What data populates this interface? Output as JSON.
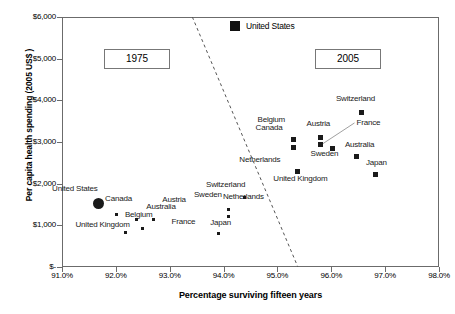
{
  "chart_data": {
    "type": "scatter",
    "title": "",
    "xlabel": "Percentage surviving fifteen years",
    "ylabel": "Per capita health spending (2005 US$ )",
    "xlim": [
      91.0,
      98.0
    ],
    "ylim": [
      0,
      6000
    ],
    "xticks": [
      "91.0%",
      "92.0%",
      "93.0%",
      "94.0%",
      "95.0%",
      "96.0%",
      "97.0%",
      "98.0%"
    ],
    "xtick_values": [
      91.0,
      92.0,
      93.0,
      94.0,
      95.0,
      96.0,
      97.0,
      98.0
    ],
    "yticks": [
      "$-",
      "$1,000",
      "$2,000",
      "$3,000",
      "$4,000",
      "$5,000",
      "$6,000"
    ],
    "ytick_values": [
      0,
      1000,
      2000,
      3000,
      4000,
      5000,
      6000
    ],
    "grid": false,
    "legend_position": "top-center",
    "legend": [
      {
        "label": "United States",
        "marker": "filled-square"
      }
    ],
    "annotations": [
      {
        "text": "1975",
        "type": "boxed-era-label"
      },
      {
        "text": "2005",
        "type": "boxed-era-label"
      },
      {
        "text": "",
        "type": "dashed-divider-line",
        "from": [
          93.42,
          6000
        ],
        "to": [
          95.38,
          0
        ]
      }
    ],
    "series": [
      {
        "name": "1975",
        "points": [
          {
            "label": "United States",
            "x": 91.67,
            "y": 1530,
            "marker": "big-circle",
            "label_dx": -46,
            "label_dy": -14
          },
          {
            "label": "Canada",
            "x": 91.67,
            "y": 1530,
            "marker": "none",
            "label_dx": 7,
            "label_dy": -4
          },
          {
            "label": "Austria",
            "x": 92.38,
            "y": 1130,
            "marker": "small-square",
            "label_dx": 26,
            "label_dy": -20
          },
          {
            "label": "Australia",
            "x": 92.38,
            "y": 1130,
            "marker": "none",
            "label_dx": 10,
            "label_dy": -13
          },
          {
            "label": "Belgium",
            "x": 92.02,
            "y": 1250,
            "marker": "small-square",
            "label_dx": 8,
            "label_dy": 0
          },
          {
            "label": "United Kingdom",
            "x": 92.18,
            "y": 820,
            "marker": "small-square",
            "label_dx": -50,
            "label_dy": -8
          },
          {
            "label": "France",
            "x": 92.7,
            "y": 1140,
            "marker": "small-square",
            "label_dx": 18,
            "label_dy": 2
          },
          {
            "label": "",
            "x": 92.5,
            "y": 930,
            "marker": "small-square",
            "label_dx": 0,
            "label_dy": 0
          },
          {
            "label": "Switzerland",
            "x": 94.38,
            "y": 1660,
            "marker": "small-square",
            "label_dx": -38,
            "label_dy": -13
          },
          {
            "label": "Sweden",
            "x": 94.1,
            "y": 1220,
            "marker": "small-square",
            "label_dx": -35,
            "label_dy": -21
          },
          {
            "label": "Netherlands",
            "x": 94.1,
            "y": 1380,
            "marker": "small-square",
            "label_dx": -6,
            "label_dy": -13
          },
          {
            "label": "Japan",
            "x": 93.9,
            "y": 800,
            "marker": "small-square",
            "label_dx": -8,
            "label_dy": -11
          }
        ]
      },
      {
        "name": "2005",
        "points": [
          {
            "label": "Switzerland",
            "x": 96.57,
            "y": 3710,
            "marker": "square",
            "label_dx": -26,
            "label_dy": -13
          },
          {
            "label": "Belgium",
            "x": 95.3,
            "y": 3050,
            "marker": "square",
            "label_dx": -36,
            "label_dy": -20
          },
          {
            "label": "Canada",
            "x": 95.3,
            "y": 2860,
            "marker": "square",
            "label_dx": -38,
            "label_dy": -20
          },
          {
            "label": "Austria",
            "x": 95.8,
            "y": 3120,
            "marker": "square",
            "label_dx": -14,
            "label_dy": -13
          },
          {
            "label": "France",
            "x": 95.8,
            "y": 2930,
            "marker": "square",
            "label_dx": 36,
            "label_dy": -22
          },
          {
            "label": "Australia",
            "x": 96.03,
            "y": 2840,
            "marker": "square",
            "label_dx": 12,
            "label_dy": -4
          },
          {
            "label": "Sweden",
            "x": 96.47,
            "y": 2660,
            "marker": "square",
            "label_dx": -46,
            "label_dy": -2
          },
          {
            "label": "Netherlands",
            "x": 95.37,
            "y": 2300,
            "marker": "square",
            "label_dx": -58,
            "label_dy": -11
          },
          {
            "label": "Japan",
            "x": 96.83,
            "y": 2210,
            "marker": "square",
            "label_dx": -10,
            "label_dy": -12
          },
          {
            "label": "United Kingdom",
            "x": 95.37,
            "y": 2300,
            "marker": "none",
            "label_dx": -24,
            "label_dy": 8
          }
        ]
      }
    ]
  },
  "figure": {
    "era_left": "1975",
    "era_right": "2005",
    "legend_label": "United States"
  }
}
